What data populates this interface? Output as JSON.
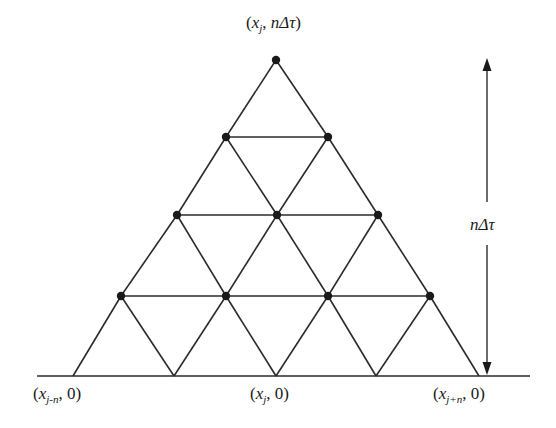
{
  "diagram": {
    "type": "recombining-triangular-lattice",
    "colors": {
      "line": "#2b2b2b",
      "node": "#1a1a1a",
      "background": "#ffffff"
    },
    "baseline": {
      "x1": 37,
      "x2": 530,
      "y": 376
    },
    "nodes": [
      {
        "row": 0,
        "points": [
          [
            276,
            60
          ]
        ]
      },
      {
        "row": 1,
        "points": [
          [
            226,
            137
          ],
          [
            328,
            137
          ]
        ]
      },
      {
        "row": 2,
        "points": [
          [
            177,
            215
          ],
          [
            277,
            215
          ],
          [
            378,
            215
          ]
        ]
      },
      {
        "row": 3,
        "points": [
          [
            121,
            296
          ],
          [
            226,
            296
          ],
          [
            328,
            296
          ],
          [
            430,
            296
          ]
        ]
      }
    ],
    "base_points": [
      [
        73,
        376
      ],
      [
        174,
        376
      ],
      [
        276,
        376
      ],
      [
        376,
        376
      ],
      [
        479,
        376
      ]
    ],
    "labels": {
      "top": {
        "open": "(",
        "var": "x",
        "sub": "j",
        "sep": ", ",
        "time": "nΔτ",
        "close": ")"
      },
      "bottom_left": {
        "open": "(",
        "var": "x",
        "sub": "j-n",
        "sep": ", ",
        "time": "0",
        "close": ")"
      },
      "bottom_center": {
        "open": "(",
        "var": "x",
        "sub": "j",
        "sep": ", ",
        "time": "0",
        "close": ")"
      },
      "bottom_right": {
        "open": "(",
        "var": "x",
        "sub": "j+n",
        "sep": ", ",
        "time": "0",
        "close": ")"
      },
      "height": "nΔτ"
    },
    "arrow": {
      "x": 487,
      "y_top": 60,
      "y_bottom": 376,
      "gap_top": 202,
      "gap_bottom": 245
    }
  }
}
